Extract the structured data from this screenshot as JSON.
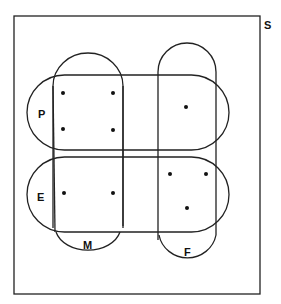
{
  "diagram": {
    "universe_label": "S",
    "sets": [
      {
        "id": "P",
        "label": "P"
      },
      {
        "id": "E",
        "label": "E"
      },
      {
        "id": "M",
        "label": "M"
      },
      {
        "id": "F",
        "label": "F"
      }
    ],
    "regions": [
      {
        "sets": [
          "P",
          "M"
        ],
        "points": 4
      },
      {
        "sets": [
          "P",
          "F"
        ],
        "points": 1
      },
      {
        "sets": [
          "E",
          "M"
        ],
        "points": 2
      },
      {
        "sets": [
          "E",
          "F"
        ],
        "points": 3
      }
    ],
    "stroke_color": "#222222"
  }
}
